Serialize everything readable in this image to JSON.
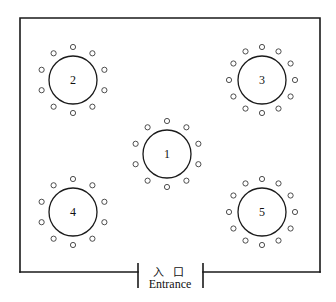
{
  "diagram": {
    "colors": {
      "wall": "#1a1a1a",
      "table_stroke": "#1a1a1a",
      "seat_stroke": "#3a3a3a",
      "background": "#ffffff",
      "text": "#111111"
    },
    "room": {
      "x": 20,
      "y": 18,
      "width": 300,
      "height": 254
    },
    "entrance": {
      "label_cjk": "入 口",
      "label_en": "Entrance",
      "gap_left_x": 138,
      "gap_right_x": 203,
      "tick_top_y": 263,
      "tick_bottom_y": 288,
      "baseline_y": 272,
      "cjk_text_x": 170,
      "cjk_text_y": 276,
      "en_text_x": 170,
      "en_text_y": 288
    },
    "tables": [
      {
        "id": "table-1",
        "label": "1",
        "cx": 167,
        "cy": 154,
        "radius": 24,
        "seat_count": 10,
        "seat_radius": 2.6,
        "seat_orbit": 33,
        "seat_start_angle": -90
      },
      {
        "id": "table-2",
        "label": "2",
        "cx": 73,
        "cy": 80,
        "radius": 24,
        "seat_count": 10,
        "seat_radius": 2.6,
        "seat_orbit": 33,
        "seat_start_angle": -90
      },
      {
        "id": "table-3",
        "label": "3",
        "cx": 262,
        "cy": 80,
        "radius": 24,
        "seat_count": 12,
        "seat_radius": 2.6,
        "seat_orbit": 33,
        "seat_start_angle": -90
      },
      {
        "id": "table-4",
        "label": "4",
        "cx": 73,
        "cy": 212,
        "radius": 24,
        "seat_count": 10,
        "seat_radius": 2.6,
        "seat_orbit": 33,
        "seat_start_angle": -90
      },
      {
        "id": "table-5",
        "label": "5",
        "cx": 262,
        "cy": 212,
        "radius": 24,
        "seat_count": 12,
        "seat_radius": 2.6,
        "seat_orbit": 33,
        "seat_start_angle": -90
      }
    ]
  }
}
